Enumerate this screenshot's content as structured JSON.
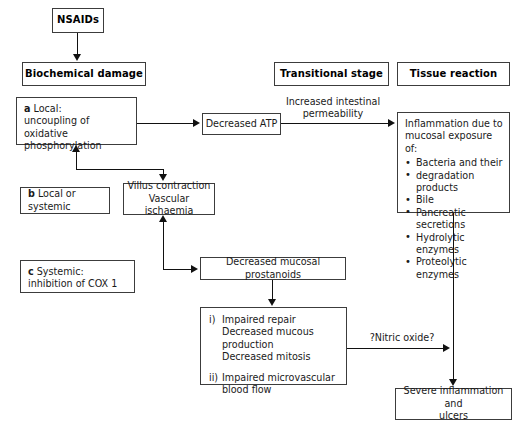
{
  "diagram": {
    "headers": {
      "biochemical_damage": "Biochemical damage",
      "transitional_stage": "Transitional stage",
      "tissue_reaction": "Tissue reaction"
    },
    "nodes": {
      "nsaids": "NSAIDs",
      "decreased_atp": "Decreased ATP",
      "local_uncoupling": {
        "tag": "a",
        "line1": "Local:",
        "line2": "uncoupling of",
        "line3": "oxidative phosphorylation"
      },
      "local_or_systemic": {
        "tag": "b",
        "text": "Local or systemic"
      },
      "systemic_cox": {
        "tag": "c",
        "line1": "Systemic:",
        "line2": "inhibition of COX 1"
      },
      "villus": {
        "line1": "Villus contraction",
        "line2": "Vascular ischaemia"
      },
      "prostanoids": "Decreased mucosal prostanoids",
      "impaired": {
        "i_mark": "i)",
        "i_line1": "Impaired repair",
        "i_line2": "Decreased mucous production",
        "i_line3": "Decreased mitosis",
        "ii_mark": "ii)",
        "ii_line1": "Impaired microvascular",
        "ii_line2": "blood flow"
      },
      "inflammation": {
        "line1": "Inflammation due to",
        "line2": "mucosal exposure of:",
        "bullets": [
          "Bacteria and their",
          "degradation products",
          "Bile",
          "Pancreatic secretions",
          "Hydrolytic enzymes",
          "Proteolytic enzymes"
        ]
      },
      "severe": {
        "line1": "Severe inflammation and",
        "line2": "ulcers"
      }
    },
    "edge_labels": {
      "increased_permeability_line1": "Increased intestinal",
      "increased_permeability_line2": "permeability",
      "nitric_oxide": "?Nitric oxide?"
    },
    "colors": {
      "line": "#111111",
      "border": "#3c3c3c",
      "text": "#1a1a1a",
      "background": "#ffffff"
    }
  }
}
